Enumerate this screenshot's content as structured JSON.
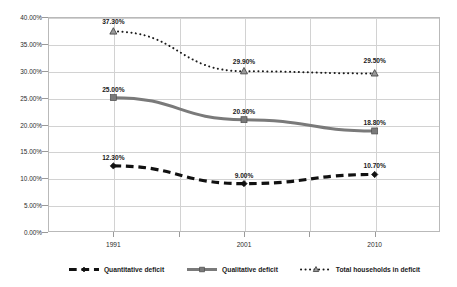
{
  "chart_data": {
    "type": "line",
    "title": "",
    "subtitle": "",
    "xlabel": "",
    "ylabel": "",
    "categories": [
      "1991",
      "2001",
      "2010"
    ],
    "x": [
      1991,
      2001,
      2010
    ],
    "ylim": [
      0,
      40
    ],
    "ytick_labels": [
      "0.00%",
      "5.00%",
      "10.00%",
      "15.00%",
      "20.00%",
      "25.00%",
      "30.00%",
      "35.00%",
      "40.00%"
    ],
    "ytick_values": [
      0,
      5,
      10,
      15,
      20,
      25,
      30,
      35,
      40
    ],
    "grid": "both",
    "legend_position": "bottom",
    "series": [
      {
        "name": "Quantitative deficit",
        "values": [
          12.3,
          9.0,
          10.7
        ],
        "labels": [
          "12.30%",
          "9.00%",
          "10.70%"
        ],
        "color": "#111111",
        "style": "dashed",
        "marker": "diamond",
        "width": 3.2
      },
      {
        "name": "Qualitative deficit",
        "values": [
          25.0,
          20.9,
          18.8
        ],
        "labels": [
          "25.00%",
          "20.90%",
          "18.80%"
        ],
        "color": "#7a7a7a",
        "style": "solid",
        "marker": "square",
        "width": 3.0
      },
      {
        "name": "Total households in deficit",
        "values": [
          37.3,
          29.9,
          29.5
        ],
        "labels": [
          "37.30%",
          "29.90%",
          "29.50%"
        ],
        "color": "#1a1a1a",
        "style": "dotted",
        "marker": "triangle",
        "width": 2.0
      }
    ]
  },
  "legend": {
    "items": [
      {
        "label": "Quantitative deficit"
      },
      {
        "label": "Qualitative deficit"
      },
      {
        "label": "Total households in deficit"
      }
    ]
  },
  "colors": {
    "plot_border": "#b9b9b9",
    "gridline": "#d2d2d2",
    "axis_text": "#2b2b2b",
    "background": "#ffffff"
  }
}
